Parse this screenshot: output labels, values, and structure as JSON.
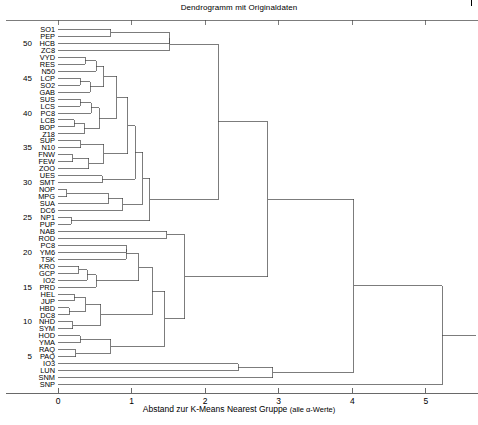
{
  "chart_data": {
    "type": "dendrogram",
    "title": "Dendrogramm mit Originaldaten",
    "xlabel_main": "Abstand zur K-Means Nearest Gruppe",
    "xlabel_paren": "(alle α-Werte)",
    "ylabel": "",
    "xlim": [
      0,
      5.6
    ],
    "xticks": [
      0,
      1,
      2,
      3,
      4,
      5
    ],
    "xticklabels": [
      "0",
      "1",
      "2",
      "3",
      "4",
      "5"
    ],
    "yticks": [
      50,
      45,
      40,
      35,
      30,
      25,
      20,
      15,
      10,
      5
    ],
    "yticklabels": [
      "50",
      "45",
      "40",
      "35",
      "30",
      "25",
      "20",
      "15",
      "10",
      "5"
    ],
    "grid": false,
    "orientation": "horizontal",
    "leaf_count": 53,
    "leaves": [
      "SO1",
      "PEP",
      "HCB",
      "ZC8",
      "VYD",
      "RES",
      "N50",
      "LCP",
      "SO2",
      "GAB",
      "SUS",
      "LCS",
      "PC8",
      "LCB",
      "BOP",
      "Z18",
      "SUP",
      "N10",
      "FNW",
      "FEW",
      "ZOO",
      "UES",
      "SMT",
      "NOP",
      "MPG",
      "SUA",
      "DC6",
      "NP1",
      "PUP",
      "NAB",
      "ROD",
      "PC8",
      "YM6",
      "TSK",
      "KRO",
      "GCP",
      "IO2",
      "PRD",
      "HEL",
      "JUP",
      "HBD",
      "DC8",
      "NHD",
      "SYM",
      "HOD",
      "YMA",
      "RAQ",
      "PAQ",
      "IO3",
      "LUN",
      "SNM",
      "SNP"
    ],
    "merges": [
      {
        "id": "m1",
        "left": {
          "leaf": 0
        },
        "right": {
          "leaf": 1
        },
        "height": 0.72
      },
      {
        "id": "m2",
        "left": {
          "node": "m1"
        },
        "right": {
          "leaf": 2
        },
        "height": 1.52
      },
      {
        "id": "m3",
        "left": {
          "node": "m2"
        },
        "right": {
          "leaf": 3
        },
        "height": 1.52
      },
      {
        "id": "m4",
        "left": {
          "leaf": 4
        },
        "right": {
          "leaf": 5
        },
        "height": 0.37
      },
      {
        "id": "m5",
        "left": {
          "node": "m4"
        },
        "right": {
          "leaf": 6
        },
        "height": 0.52
      },
      {
        "id": "m6",
        "left": {
          "leaf": 7
        },
        "right": {
          "leaf": 8
        },
        "height": 0.3
      },
      {
        "id": "m7",
        "left": {
          "node": "m6"
        },
        "right": {
          "leaf": 9
        },
        "height": 0.44
      },
      {
        "id": "m8",
        "left": {
          "node": "m5"
        },
        "right": {
          "node": "m7"
        },
        "height": 0.62
      },
      {
        "id": "m9",
        "left": {
          "leaf": 10
        },
        "right": {
          "leaf": 11
        },
        "height": 0.3
      },
      {
        "id": "m10",
        "left": {
          "node": "m9"
        },
        "right": {
          "leaf": 12
        },
        "height": 0.45
      },
      {
        "id": "m11",
        "left": {
          "leaf": 13
        },
        "right": {
          "leaf": 14
        },
        "height": 0.22
      },
      {
        "id": "m12",
        "left": {
          "node": "m11"
        },
        "right": {
          "leaf": 15
        },
        "height": 0.36
      },
      {
        "id": "m13",
        "left": {
          "node": "m10"
        },
        "right": {
          "node": "m12"
        },
        "height": 0.56
      },
      {
        "id": "m14",
        "left": {
          "node": "m8"
        },
        "right": {
          "node": "m13"
        },
        "height": 0.8
      },
      {
        "id": "m15",
        "left": {
          "leaf": 16
        },
        "right": {
          "leaf": 17
        },
        "height": 0.31
      },
      {
        "id": "m16",
        "left": {
          "leaf": 18
        },
        "right": {
          "leaf": 19
        },
        "height": 0.2
      },
      {
        "id": "m17",
        "left": {
          "node": "m16"
        },
        "right": {
          "leaf": 20
        },
        "height": 0.42
      },
      {
        "id": "m18",
        "left": {
          "node": "m15"
        },
        "right": {
          "node": "m17"
        },
        "height": 0.62
      },
      {
        "id": "m19",
        "left": {
          "node": "m14"
        },
        "right": {
          "node": "m18"
        },
        "height": 0.95
      },
      {
        "id": "m20",
        "left": {
          "leaf": 21
        },
        "right": {
          "leaf": 22
        },
        "height": 0.6
      },
      {
        "id": "m21",
        "left": {
          "node": "m19"
        },
        "right": {
          "node": "m20"
        },
        "height": 1.05
      },
      {
        "id": "m22",
        "left": {
          "leaf": 23
        },
        "right": {
          "leaf": 24
        },
        "height": 0.12
      },
      {
        "id": "m23",
        "left": {
          "node": "m22"
        },
        "right": {
          "leaf": 25
        },
        "height": 0.68
      },
      {
        "id": "m24",
        "left": {
          "node": "m23"
        },
        "right": {
          "leaf": 26
        },
        "height": 0.88
      },
      {
        "id": "m25",
        "left": {
          "node": "m21"
        },
        "right": {
          "node": "m24"
        },
        "height": 1.15
      },
      {
        "id": "m26",
        "left": {
          "leaf": 27
        },
        "right": {
          "leaf": 28
        },
        "height": 0.18
      },
      {
        "id": "m27",
        "left": {
          "node": "m25"
        },
        "right": {
          "node": "m26"
        },
        "height": 1.25
      },
      {
        "id": "m28",
        "left": {
          "node": "m3"
        },
        "right": {
          "node": "m27"
        },
        "height": 2.18
      },
      {
        "id": "m29",
        "left": {
          "leaf": 29
        },
        "right": {
          "leaf": 30
        },
        "height": 1.48
      },
      {
        "id": "m30",
        "left": {
          "leaf": 31
        },
        "right": {
          "leaf": 32
        },
        "height": 0.93
      },
      {
        "id": "m31",
        "left": {
          "node": "m30"
        },
        "right": {
          "leaf": 33
        },
        "height": 0.93
      },
      {
        "id": "m32",
        "left": {
          "leaf": 34
        },
        "right": {
          "leaf": 35
        },
        "height": 0.28
      },
      {
        "id": "m33",
        "left": {
          "node": "m32"
        },
        "right": {
          "leaf": 36
        },
        "height": 0.4
      },
      {
        "id": "m34",
        "left": {
          "node": "m33"
        },
        "right": {
          "leaf": 37
        },
        "height": 0.52
      },
      {
        "id": "m35",
        "left": {
          "node": "m31"
        },
        "right": {
          "node": "m34"
        },
        "height": 1.1
      },
      {
        "id": "m36",
        "left": {
          "leaf": 38
        },
        "right": {
          "leaf": 39
        },
        "height": 0.22
      },
      {
        "id": "m37",
        "left": {
          "leaf": 40
        },
        "right": {
          "leaf": 41
        },
        "height": 0.15
      },
      {
        "id": "m38",
        "left": {
          "node": "m36"
        },
        "right": {
          "node": "m37"
        },
        "height": 0.38
      },
      {
        "id": "m39",
        "left": {
          "leaf": 42
        },
        "right": {
          "leaf": 43
        },
        "height": 0.2
      },
      {
        "id": "m40",
        "left": {
          "node": "m38"
        },
        "right": {
          "node": "m39"
        },
        "height": 0.58
      },
      {
        "id": "m41",
        "left": {
          "node": "m35"
        },
        "right": {
          "node": "m40"
        },
        "height": 1.28
      },
      {
        "id": "m42",
        "left": {
          "leaf": 44
        },
        "right": {
          "leaf": 45
        },
        "height": 0.3
      },
      {
        "id": "m43",
        "left": {
          "leaf": 46
        },
        "right": {
          "leaf": 47
        },
        "height": 0.24
      },
      {
        "id": "m44",
        "left": {
          "node": "m42"
        },
        "right": {
          "node": "m43"
        },
        "height": 0.72
      },
      {
        "id": "m45",
        "left": {
          "node": "m41"
        },
        "right": {
          "node": "m44"
        },
        "height": 1.45
      },
      {
        "id": "m46",
        "left": {
          "node": "m29"
        },
        "right": {
          "node": "m45"
        },
        "height": 1.72
      },
      {
        "id": "m47",
        "left": {
          "node": "m28"
        },
        "right": {
          "node": "m46"
        },
        "height": 2.85
      },
      {
        "id": "m48",
        "left": {
          "leaf": 48
        },
        "right": {
          "leaf": 49
        },
        "height": 2.45
      },
      {
        "id": "m49",
        "left": {
          "node": "m48"
        },
        "right": {
          "leaf": 50
        },
        "height": 2.92
      },
      {
        "id": "m50",
        "left": {
          "node": "m47"
        },
        "right": {
          "node": "m49"
        },
        "height": 4.02
      },
      {
        "id": "m51",
        "left": {
          "node": "m50"
        },
        "right": {
          "leaf": 51
        },
        "height": 5.22
      }
    ]
  },
  "colors": {
    "line": "#444444",
    "axis": "#555555",
    "text": "#000000",
    "background": "#ffffff"
  }
}
